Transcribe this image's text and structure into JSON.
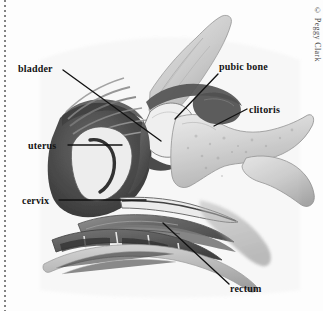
{
  "figure": {
    "credit": "© Peggy Clark",
    "background_color": "#fdfdfd",
    "ink_color": "#121212",
    "labels": [
      {
        "id": "bladder",
        "text": "bladder",
        "text_x": 18,
        "text_y": 72,
        "anchor": "start",
        "leader": "M63,70 L161,141"
      },
      {
        "id": "uterus",
        "text": "uterus",
        "text_x": 28,
        "text_y": 149,
        "anchor": "start",
        "leader": "M68,145 L122,145"
      },
      {
        "id": "cervix",
        "text": "cervix",
        "text_x": 22,
        "text_y": 204,
        "anchor": "start",
        "leader": "M59,200 L146,200"
      },
      {
        "id": "pubic-bone",
        "text": "pubic bone",
        "text_x": 219,
        "text_y": 70,
        "anchor": "start",
        "leader": "M218,74 L175,119"
      },
      {
        "id": "clitoris",
        "text": "clitoris",
        "text_x": 249,
        "text_y": 113,
        "anchor": "start",
        "leader": "M247,109 L214,126"
      },
      {
        "id": "rectum",
        "text": "rectum",
        "text_x": 230,
        "text_y": 292,
        "anchor": "start",
        "leader": "M229,284 L163,223"
      }
    ],
    "structures": [
      {
        "id": "sacrum",
        "name": "sacrum / coccyx vertebrae"
      },
      {
        "id": "pubic-bone-mass",
        "name": "pubic bone"
      },
      {
        "id": "uterus-body",
        "name": "uterus body"
      },
      {
        "id": "uterine-cavity",
        "name": "uterine cavity"
      },
      {
        "id": "bladder-cavity",
        "name": "bladder"
      },
      {
        "id": "vagina",
        "name": "vaginal canal"
      },
      {
        "id": "rectum-canal",
        "name": "rectum"
      },
      {
        "id": "perineum",
        "name": "perineal tissue"
      }
    ]
  }
}
